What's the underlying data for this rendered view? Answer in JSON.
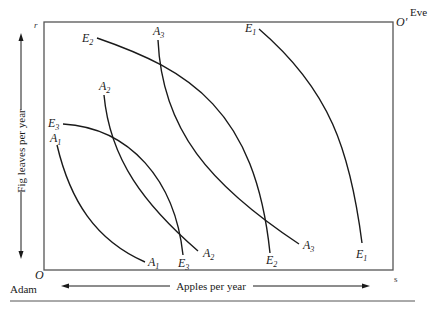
{
  "diagram": {
    "type": "edgeworth-box",
    "origin_adam": {
      "label": "O",
      "owner": "Adam"
    },
    "origin_eve": {
      "label": "O′",
      "owner": "Eve"
    },
    "corner_top_left": "r",
    "corner_bottom_right": "s",
    "x_axis_label": "Apples per year",
    "y_axis_label": "Fig leaves per year",
    "adam_curves": [
      {
        "id": "A1",
        "base": "A",
        "sub": "1"
      },
      {
        "id": "A2",
        "base": "A",
        "sub": "2"
      },
      {
        "id": "A3",
        "base": "A",
        "sub": "3"
      }
    ],
    "eve_curves": [
      {
        "id": "E1",
        "base": "E",
        "sub": "1"
      },
      {
        "id": "E2",
        "base": "E",
        "sub": "2"
      },
      {
        "id": "E3",
        "base": "E",
        "sub": "3"
      }
    ],
    "colors": {
      "line": "#1a1a1a",
      "box": "#555555",
      "background": "#ffffff"
    }
  }
}
